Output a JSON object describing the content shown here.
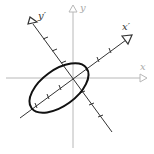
{
  "diagram": {
    "labels": {
      "x": "x",
      "y": "y",
      "x_prime": "x′",
      "y_prime": "y′"
    },
    "colors": {
      "original_axes": "#b8b8b8",
      "rotated_axes": "#333333",
      "ellipse": "#111111",
      "background": "#ffffff"
    },
    "rotation_angle_deg": 36,
    "ticks_per_rotated_half_axis": 3
  }
}
